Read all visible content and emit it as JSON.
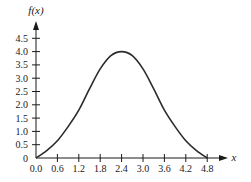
{
  "chart_data": {
    "type": "line",
    "title": "",
    "xlabel": "x",
    "ylabel": "f(x)",
    "xlim": [
      0,
      4.8
    ],
    "ylim": [
      0,
      4.5
    ],
    "grid": false,
    "legend": "none",
    "x_ticks": [
      "0.0",
      "0.6",
      "1.2",
      "1.8",
      "2.4",
      "3.0",
      "3.6",
      "4.2",
      "4.8"
    ],
    "x_tick_values": [
      0,
      0.6,
      1.2,
      1.8,
      2.4,
      3.0,
      3.6,
      4.2,
      4.8
    ],
    "y_ticks": [
      "0",
      "0.5",
      "1.0",
      "1.5",
      "2.0",
      "2.5",
      "3.0",
      "3.5",
      "4.0",
      "4.5"
    ],
    "y_tick_values": [
      0,
      0.5,
      1.0,
      1.5,
      2.0,
      2.5,
      3.0,
      3.5,
      4.0,
      4.5
    ],
    "series": [
      {
        "name": "f(x)",
        "x": [
          0,
          0.3,
          0.6,
          0.9,
          1.2,
          1.5,
          1.8,
          2.1,
          2.4,
          2.7,
          3.0,
          3.3,
          3.6,
          3.9,
          4.2,
          4.5,
          4.8
        ],
        "y": [
          0,
          0.28,
          0.65,
          1.18,
          1.8,
          2.6,
          3.35,
          3.85,
          4.0,
          3.85,
          3.35,
          2.6,
          1.8,
          1.18,
          0.65,
          0.28,
          0
        ],
        "color": "#2b2b2b"
      }
    ]
  }
}
